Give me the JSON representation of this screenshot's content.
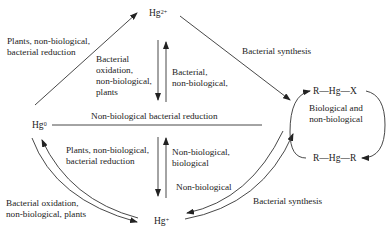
{
  "diagram": {
    "nodes": {
      "hg2": {
        "base": "Hg",
        "charge": "2+"
      },
      "hg0": {
        "base": "Hg",
        "charge": "0"
      },
      "hgplus": {
        "base": "Hg",
        "charge": "+"
      },
      "rhgx": "R—Hg—X",
      "rhgr": "R—Hg—R"
    },
    "edges": {
      "hg0_to_hg2": {
        "line1": "Plants, non-biological,",
        "line2": "bacterial reduction"
      },
      "hg2_down": {
        "line1": "Bacterial",
        "line2": "oxidation,",
        "line3": "non-biological,",
        "line4": "plants"
      },
      "hg2_up": {
        "line1": "Bacterial,",
        "line2": "non-biological,"
      },
      "hg2_to_org": "Bacterial synthesis",
      "org_cycle": {
        "line1": "Biological and",
        "line2": "non-biological"
      },
      "hg0_line": "Non-biological bacterial reduction",
      "hgplus_down": {
        "line1": "Plants, non-biological,",
        "line2": "bacterial reduction"
      },
      "hgplus_up": {
        "line1": "Non-biological,",
        "line2": "biological"
      },
      "hgplus_from_org": "Non-biological",
      "hgplus_to_org": "Bacterial synthesis",
      "hg0_hgplus": {
        "line1": "Bacterial oxidation,",
        "line2": "non-biological, plants"
      }
    }
  }
}
